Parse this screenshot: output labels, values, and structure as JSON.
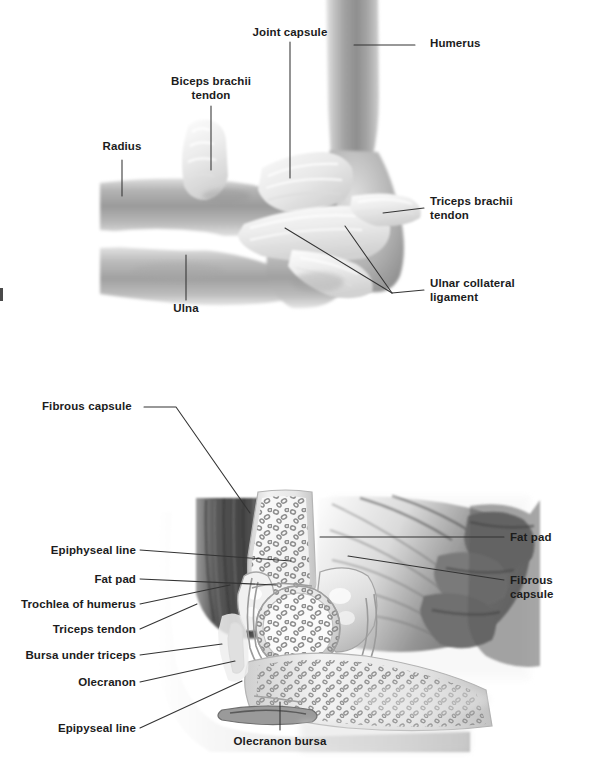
{
  "page": {
    "width": 598,
    "height": 758,
    "background": "#ffffff",
    "ink": "#1c1c1c",
    "leader_color": "#333333"
  },
  "figures": [
    {
      "id": "upper",
      "name": "elbow-joint-ligaments-lateral-view",
      "description": "Lateral view of the elbow joint showing bones, joint capsule, tendons and ligaments",
      "labels": [
        {
          "id": "joint-capsule",
          "text": "Joint capsule",
          "align": "center"
        },
        {
          "id": "humerus",
          "text": "Humerus",
          "align": "left"
        },
        {
          "id": "biceps-brachii-tendon",
          "text": "Biceps brachii\ntendon",
          "align": "center"
        },
        {
          "id": "radius",
          "text": "Radius",
          "align": "center"
        },
        {
          "id": "triceps-brachii-tendon",
          "text": "Triceps brachii\ntendon",
          "align": "left"
        },
        {
          "id": "ulnar-collateral-ligament",
          "text": "Ulnar collateral\nligament",
          "align": "left"
        },
        {
          "id": "ulna",
          "text": "Ulna",
          "align": "center"
        }
      ]
    },
    {
      "id": "lower",
      "name": "elbow-joint-sagittal-section",
      "description": "Sagittal section through the elbow joint showing capsule, fat pads, bursae and epiphyseal lines",
      "labels": [
        {
          "id": "fibrous-capsule-top",
          "text": "Fibrous capsule",
          "align": "left"
        },
        {
          "id": "fat-pad-right",
          "text": "Fat pad",
          "align": "left"
        },
        {
          "id": "fibrous-capsule-right",
          "text": "Fibrous capsule",
          "align": "left"
        },
        {
          "id": "epiphyseal-line-upper",
          "text": "Epiphyseal line",
          "align": "right"
        },
        {
          "id": "fat-pad-left",
          "text": "Fat pad",
          "align": "right"
        },
        {
          "id": "trochlea-of-humerus",
          "text": "Trochlea of humerus",
          "align": "right"
        },
        {
          "id": "triceps-tendon",
          "text": "Triceps tendon",
          "align": "right"
        },
        {
          "id": "bursa-under-triceps",
          "text": "Bursa under triceps",
          "align": "right"
        },
        {
          "id": "olecranon",
          "text": "Olecranon",
          "align": "right"
        },
        {
          "id": "epipyseal-line-lower",
          "text": "Epipyseal line",
          "align": "right"
        },
        {
          "id": "olecranon-bursa",
          "text": "Olecranon bursa",
          "align": "center"
        }
      ]
    }
  ]
}
